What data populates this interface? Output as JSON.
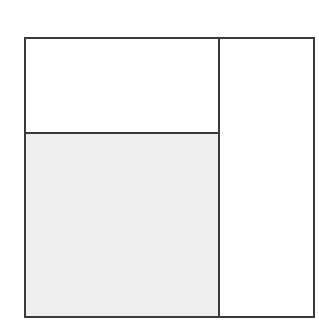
{
  "diagram": {
    "type": "partitioned-square",
    "regions": [
      {
        "id": "top-left",
        "fill": "#ffffff",
        "label": ""
      },
      {
        "id": "bottom-left",
        "fill": "#eeeeee",
        "label": ""
      },
      {
        "id": "right",
        "fill": "#ffffff",
        "label": ""
      }
    ],
    "stroke_color": "#3a3a3a",
    "shaded_fill": "#eeeeee"
  }
}
